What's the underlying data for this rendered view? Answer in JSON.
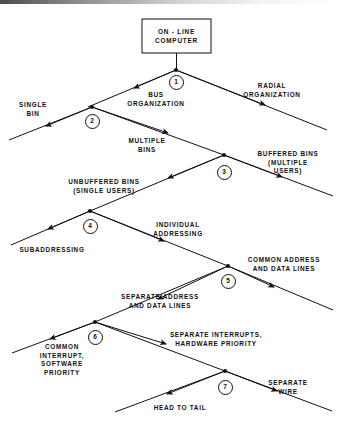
{
  "figure": {
    "type": "decision-tree-diagram",
    "root": {
      "label": "ON - LINE\nCOMPUTER"
    },
    "nodes": [
      {
        "id": "1",
        "number": "1",
        "x": 176,
        "y": 82
      },
      {
        "id": "2",
        "number": "2",
        "x": 92,
        "y": 121
      },
      {
        "id": "3",
        "number": "3",
        "x": 224,
        "y": 172
      },
      {
        "id": "4",
        "number": "4",
        "x": 90,
        "y": 226
      },
      {
        "id": "5",
        "number": "5",
        "x": 228,
        "y": 281
      },
      {
        "id": "6",
        "number": "6",
        "x": 95,
        "y": 337
      },
      {
        "id": "7",
        "number": "7",
        "x": 225,
        "y": 387
      }
    ],
    "branch_labels": [
      {
        "id": "bus-organization",
        "text": "BUS\nORGANIZATION",
        "x": 156,
        "y": 91,
        "align": "center"
      },
      {
        "id": "radial-organization",
        "text": "RADIAL\nORGANIZATION",
        "x": 272,
        "y": 82,
        "align": "center"
      },
      {
        "id": "single-bin",
        "text": "SINGLE\nBIN",
        "x": 33,
        "y": 101,
        "align": "center"
      },
      {
        "id": "multiple-bins",
        "text": "MULTIPLE\nBINS",
        "x": 147,
        "y": 137,
        "align": "center"
      },
      {
        "id": "buffered-bins",
        "text": "BUFFERED BINS\n(MULTIPLE\nUSERS)",
        "x": 288,
        "y": 150,
        "align": "center"
      },
      {
        "id": "unbuffered-bins",
        "text": "UNBUFFERED BINS\n(SINGLE USERS)",
        "x": 104,
        "y": 178,
        "align": "center"
      },
      {
        "id": "individual-addressing",
        "text": "INDIVIDUAL\nADDRESSING",
        "x": 178,
        "y": 221,
        "align": "center"
      },
      {
        "id": "subaddressing",
        "text": "SUBADDRESSING",
        "x": 52,
        "y": 246,
        "align": "center"
      },
      {
        "id": "common-address",
        "text": "COMMON ADDRESS\nAND DATA LINES",
        "x": 284,
        "y": 256,
        "align": "center"
      },
      {
        "id": "separate-address",
        "text": "SEPARATE ADDRESS\nAND DATA LINES",
        "x": 160,
        "y": 293,
        "align": "center"
      },
      {
        "id": "separate-interrupts",
        "text": "SEPARATE INTERRUPTS,\nHARDWARE PRIORITY",
        "x": 216,
        "y": 331,
        "align": "center"
      },
      {
        "id": "common-interrupt",
        "text": "COMMON\nINTERRUPT,\nSOFTWARE\nPRIORITY",
        "x": 62,
        "y": 343,
        "align": "center"
      },
      {
        "id": "separate-wire",
        "text": "SEPARATE\nWIRE",
        "x": 288,
        "y": 379,
        "align": "center"
      },
      {
        "id": "head-to-tail",
        "text": "HEAD TO TAIL",
        "x": 180,
        "y": 404,
        "align": "center"
      }
    ]
  },
  "colors": {
    "ink": "#111111",
    "paper": "#ffffff"
  }
}
